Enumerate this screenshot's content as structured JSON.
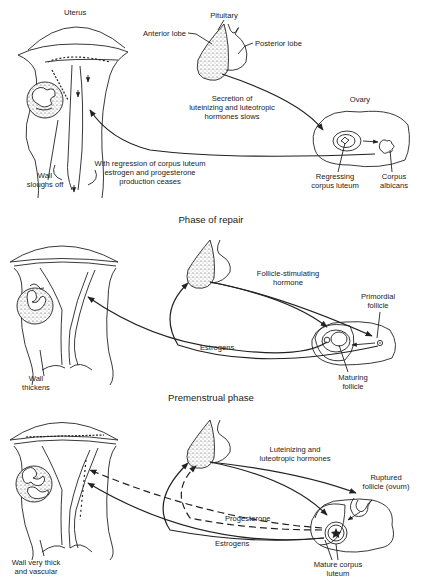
{
  "diagram": {
    "panels": [
      {
        "id": "menstrual",
        "heading": "",
        "labels": {
          "uterus": "Uterus",
          "pituitary": "Pituitary",
          "anterior_lobe": "Anterior lobe",
          "posterior_lobe": "Posterior lobe",
          "secretion_1": "Secretion of",
          "secretion_2": "luteinizing and luteotropic",
          "secretion_3": "hormones slows",
          "ovary": "Ovary",
          "wall_1": "Wall",
          "wall_2": "sloughs off",
          "regression_1": "With regression of corpus luteum",
          "regression_2": "estrogen and progesterone",
          "regression_3": "production ceases",
          "regressing_1": "Regressing",
          "regressing_2": "corpus luteum",
          "albicans_1": "Corpus",
          "albicans_2": "albicans"
        }
      },
      {
        "id": "repair",
        "heading": "Phase of repair",
        "labels": {
          "fsh_1": "Follicle-stimulating",
          "fsh_2": "hormone",
          "primordial_1": "Primordial",
          "primordial_2": "follicle",
          "estrogens": "Estrogens",
          "wall_1": "Wall",
          "wall_2": "thickens",
          "maturing_1": "Maturing",
          "maturing_2": "follicle"
        }
      },
      {
        "id": "premenstrual",
        "heading": "Premenstrual phase",
        "labels": {
          "lh_1": "Luteinizing and",
          "lh_2": "luteotropic hormones",
          "ruptured_1": "Ruptured",
          "ruptured_2": "follicle (ovum)",
          "progesterone": "Progesterone",
          "estrogens": "Estrogens",
          "wall_1": "Wall very thick",
          "wall_2": "and vascular",
          "mature_1": "Mature corpus",
          "mature_2": "luteum"
        }
      }
    ]
  }
}
